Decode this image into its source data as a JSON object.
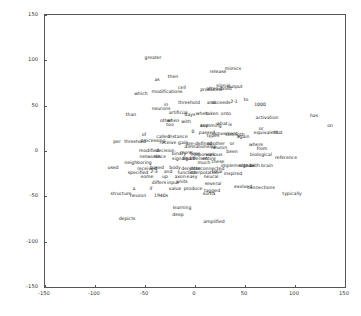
{
  "chart_data": {
    "type": "scatter",
    "title": "",
    "xlabel": "",
    "ylabel": "",
    "xlim": [
      -150,
      150
    ],
    "ylim": [
      -150,
      150
    ],
    "xticks": [
      -150,
      -100,
      -50,
      0,
      50,
      100,
      150
    ],
    "yticks": [
      -150,
      -100,
      -50,
      0,
      50,
      100,
      150
    ],
    "grid": false,
    "legend": null,
    "point_labels": true,
    "points": [
      {
        "label": "greater",
        "x": -42,
        "y": 104
      },
      {
        "label": "mimics",
        "x": 38,
        "y": 92
      },
      {
        "label": "release",
        "x": 23,
        "y": 88
      },
      {
        "label": "then",
        "x": -22,
        "y": 83
      },
      {
        "label": "as",
        "x": -38,
        "y": 79
      },
      {
        "label": "output",
        "x": 40,
        "y": 72
      },
      {
        "label": "signal",
        "x": 28,
        "y": 73
      },
      {
        "label": "cell",
        "x": -13,
        "y": 71
      },
      {
        "label": "attenuated",
        "x": 24,
        "y": 69
      },
      {
        "label": "produced",
        "x": 16,
        "y": 68
      },
      {
        "label": "modifications",
        "x": -28,
        "y": 66
      },
      {
        "label": "which",
        "x": -54,
        "y": 64
      },
      {
        "label": "to",
        "x": 51,
        "y": 57
      },
      {
        "label": "1000",
        "x": 65,
        "y": 52
      },
      {
        "label": "2-1",
        "x": 39,
        "y": 55
      },
      {
        "label": "exceeds",
        "x": 26,
        "y": 54
      },
      {
        "label": "and",
        "x": 16,
        "y": 54
      },
      {
        "label": "threshold",
        "x": -6,
        "y": 54
      },
      {
        "label": "in",
        "x": -29,
        "y": 52
      },
      {
        "label": "neurons",
        "x": -34,
        "y": 47
      },
      {
        "label": "artificial",
        "x": -17,
        "y": 43
      },
      {
        "label": "days",
        "x": -5,
        "y": 41
      },
      {
        "label": "when",
        "x": 7,
        "y": 42
      },
      {
        "label": "taken",
        "x": 17,
        "y": 42
      },
      {
        "label": "onto",
        "x": 31,
        "y": 42
      },
      {
        "label": "than",
        "x": -64,
        "y": 41
      },
      {
        "label": "has",
        "x": 119,
        "y": 40
      },
      {
        "label": "activation",
        "x": 72,
        "y": 38
      },
      {
        "label": "other",
        "x": -29,
        "y": 34
      },
      {
        "label": "when",
        "x": -22,
        "y": 34
      },
      {
        "label": "with",
        "x": -9,
        "y": 33
      },
      {
        "label": "too",
        "x": -25,
        "y": 30
      },
      {
        "label": "any",
        "x": 9,
        "y": 29
      },
      {
        "label": "summing",
        "x": 16,
        "y": 29
      },
      {
        "label": "what",
        "x": 27,
        "y": 31
      },
      {
        "label": "is",
        "x": 35,
        "y": 30
      },
      {
        "label": "on",
        "x": 135,
        "y": 29
      },
      {
        "label": "or",
        "x": 66,
        "y": 25
      },
      {
        "label": "equivalent",
        "x": 71,
        "y": 21
      },
      {
        "label": "that",
        "x": 83,
        "y": 21
      },
      {
        "label": "0",
        "x": -2,
        "y": 22
      },
      {
        "label": "passed",
        "x": 12,
        "y": 21
      },
      {
        "label": "convenient",
        "x": 30,
        "y": 20
      },
      {
        "label": "types",
        "x": 18,
        "y": 18
      },
      {
        "label": "strength",
        "x": 40,
        "y": 19
      },
      {
        "label": "again",
        "x": 48,
        "y": 16
      },
      {
        "label": "of",
        "x": -51,
        "y": 19
      },
      {
        "label": "called",
        "x": -32,
        "y": 16
      },
      {
        "label": "instance",
        "x": -17,
        "y": 16
      },
      {
        "label": "per",
        "x": -78,
        "y": 11
      },
      {
        "label": "threshold",
        "x": -60,
        "y": 11
      },
      {
        "label": "processing",
        "x": -42,
        "y": 12
      },
      {
        "label": "receive",
        "x": -27,
        "y": 10
      },
      {
        "label": "gain",
        "x": -12,
        "y": 10
      },
      {
        "label": "pre-defined",
        "x": 4,
        "y": 9
      },
      {
        "label": "another",
        "x": 21,
        "y": 9
      },
      {
        "label": "or",
        "x": 37,
        "y": 9
      },
      {
        "label": "where",
        "x": 61,
        "y": 8
      },
      {
        "label": "all",
        "x": -8,
        "y": 5
      },
      {
        "label": "relationship",
        "x": 8,
        "y": 5
      },
      {
        "label": "neuron",
        "x": 24,
        "y": 4
      },
      {
        "label": "from",
        "x": 67,
        "y": 3
      },
      {
        "label": "modified",
        "x": -46,
        "y": 1
      },
      {
        "label": "decision",
        "x": -30,
        "y": 1
      },
      {
        "label": "binary",
        "x": -16,
        "y": -2
      },
      {
        "label": "more",
        "x": -9,
        "y": -1
      },
      {
        "label": "fires",
        "x": 0,
        "y": -2
      },
      {
        "label": "responses",
        "x": 8,
        "y": -3
      },
      {
        "label": "various",
        "x": 19,
        "y": -3
      },
      {
        "label": "been",
        "x": 37,
        "y": 0
      },
      {
        "label": "biological",
        "x": 66,
        "y": -3
      },
      {
        "label": "networks",
        "x": -45,
        "y": -5
      },
      {
        "label": "since",
        "x": -35,
        "y": -6
      },
      {
        "label": "signals",
        "x": -15,
        "y": -8
      },
      {
        "label": "figure",
        "x": -6,
        "y": -8
      },
      {
        "label": "different",
        "x": 3,
        "y": -8
      },
      {
        "label": "entire",
        "x": 14,
        "y": -8
      },
      {
        "label": "reference",
        "x": 91,
        "y": -7
      },
      {
        "label": "neighboring",
        "x": -57,
        "y": -12
      },
      {
        "label": "much",
        "x": 9,
        "y": -12
      },
      {
        "label": "these",
        "x": 23,
        "y": -11
      },
      {
        "label": "implemented",
        "x": 41,
        "y": -15
      },
      {
        "label": "signals",
        "x": 52,
        "y": -15
      },
      {
        "label": "with",
        "x": 60,
        "y": -15
      },
      {
        "label": "brain",
        "x": 72,
        "y": -15
      },
      {
        "label": "used",
        "x": -82,
        "y": -18
      },
      {
        "label": "received",
        "x": -48,
        "y": -19
      },
      {
        "label": "based",
        "x": -38,
        "y": -18
      },
      {
        "label": "body",
        "x": -20,
        "y": -18
      },
      {
        "label": "dendrite",
        "x": -4,
        "y": -19
      },
      {
        "label": "interconnected",
        "x": 12,
        "y": -19
      },
      {
        "label": "specified",
        "x": -57,
        "y": -23
      },
      {
        "label": "2-3",
        "x": -41,
        "y": -22
      },
      {
        "label": "and",
        "x": -27,
        "y": -22
      },
      {
        "label": "function",
        "x": -8,
        "y": -23
      },
      {
        "label": "interpolation",
        "x": 9,
        "y": -23
      },
      {
        "label": "total",
        "x": 22,
        "y": -22
      },
      {
        "label": "inspired",
        "x": 38,
        "y": -24
      },
      {
        "label": "some",
        "x": -48,
        "y": -28
      },
      {
        "label": "up",
        "x": -30,
        "y": -28
      },
      {
        "label": "axon",
        "x": -15,
        "y": -28
      },
      {
        "label": "easy",
        "x": -3,
        "y": -28
      },
      {
        "label": "neural",
        "x": 16,
        "y": -28
      },
      {
        "label": "differs",
        "x": -36,
        "y": -34
      },
      {
        "label": "input",
        "x": -22,
        "y": -34
      },
      {
        "label": "units",
        "x": -13,
        "y": -33
      },
      {
        "label": "several",
        "x": 18,
        "y": -35
      },
      {
        "label": "evolved",
        "x": 48,
        "y": -39
      },
      {
        "label": "connections",
        "x": 66,
        "y": -40
      },
      {
        "label": "a",
        "x": -61,
        "y": -41
      },
      {
        "label": "if",
        "x": -44,
        "y": -41
      },
      {
        "label": "value",
        "x": -20,
        "y": -41
      },
      {
        "label": "produce",
        "x": -2,
        "y": -41
      },
      {
        "label": "tagged",
        "x": 17,
        "y": -43
      },
      {
        "label": "structure",
        "x": -74,
        "y": -46
      },
      {
        "label": "soma",
        "x": 14,
        "y": -46
      },
      {
        "label": "typically",
        "x": 97,
        "y": -46
      },
      {
        "label": "neuron",
        "x": -57,
        "y": -49
      },
      {
        "label": "1940s",
        "x": -34,
        "y": -48
      },
      {
        "label": "learning",
        "x": -13,
        "y": -62
      },
      {
        "label": "deep",
        "x": -17,
        "y": -70
      },
      {
        "label": "amplified",
        "x": 19,
        "y": -77
      },
      {
        "label": "depicts",
        "x": -68,
        "y": -74
      }
    ]
  },
  "axes": {
    "x_tick_labels": [
      "-150",
      "-100",
      "-50",
      "0",
      "50",
      "100",
      "150"
    ],
    "y_tick_labels": [
      "-150",
      "-100",
      "-50",
      "0",
      "50",
      "100",
      "150"
    ]
  }
}
